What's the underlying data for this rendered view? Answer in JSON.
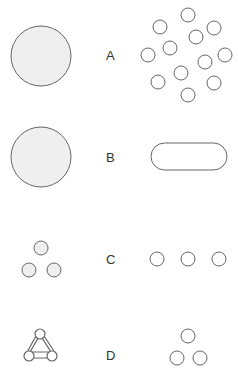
{
  "rows": [
    {
      "label": "A",
      "left": "large filled circle",
      "right": "twelve scattered small circles"
    },
    {
      "label": "B",
      "left": "large filled circle",
      "right": "rounded rectangle (stadium)"
    },
    {
      "label": "C",
      "left": "three small filled circles in triangle",
      "right": "three small circles in a row"
    },
    {
      "label": "D",
      "left": "three circles joined by triangle",
      "right": "three small circles in triangle"
    }
  ],
  "colors": {
    "stroke": "#666666",
    "fill": "#eeeeee"
  }
}
